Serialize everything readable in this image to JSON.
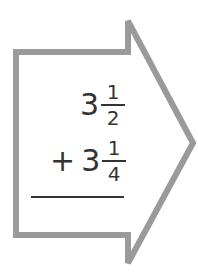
{
  "problem": {
    "addend1": {
      "whole": "3",
      "numerator": "1",
      "denominator": "2"
    },
    "operator": "+",
    "addend2": {
      "whole": "3",
      "numerator": "1",
      "denominator": "4"
    },
    "answer": ""
  },
  "colors": {
    "arrow_border": "#9a9a9a",
    "text": "#333333"
  }
}
